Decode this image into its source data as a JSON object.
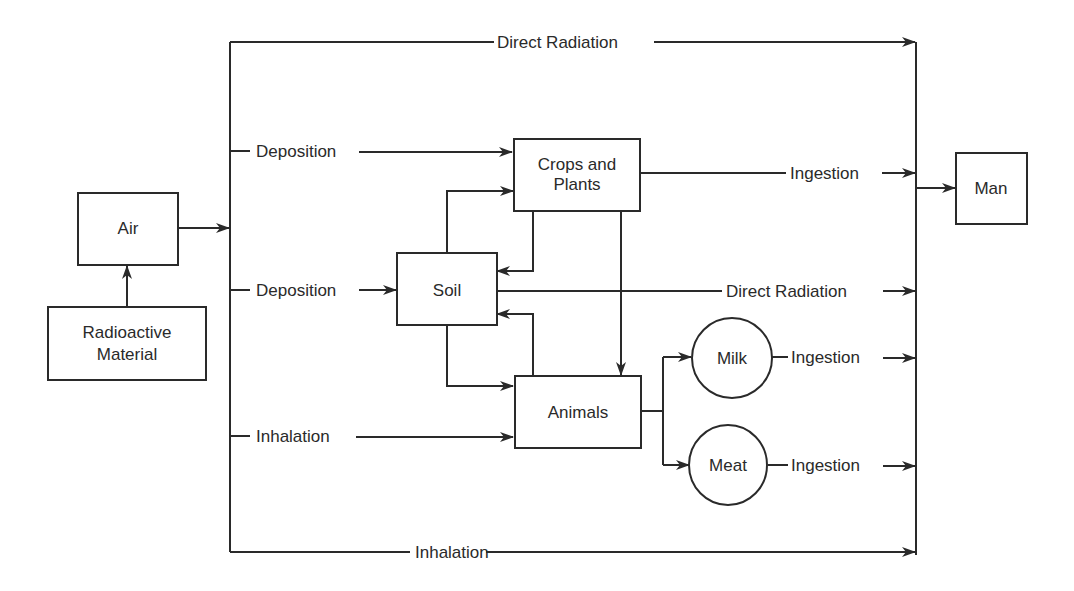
{
  "diagram": {
    "type": "flow",
    "nodes": {
      "radioactive": {
        "line1": "Radioactive",
        "line2": "Material"
      },
      "air": {
        "label": "Air"
      },
      "crops": {
        "line1": "Crops and",
        "line2": "Plants"
      },
      "soil": {
        "label": "Soil"
      },
      "animals": {
        "label": "Animals"
      },
      "milk": {
        "label": "Milk"
      },
      "meat": {
        "label": "Meat"
      },
      "man": {
        "label": "Man"
      }
    },
    "edges": {
      "top_direct_radiation": "Direct Radiation",
      "deposition_crops": "Deposition",
      "deposition_soil": "Deposition",
      "inhalation_animals": "Inhalation",
      "bottom_inhalation": "Inhalation",
      "crops_ingestion": "Ingestion",
      "soil_direct_radiation": "Direct Radiation",
      "milk_ingestion": "Ingestion",
      "meat_ingestion": "Ingestion"
    },
    "colors": {
      "stroke": "#2a2a2a",
      "background": "#ffffff"
    }
  }
}
